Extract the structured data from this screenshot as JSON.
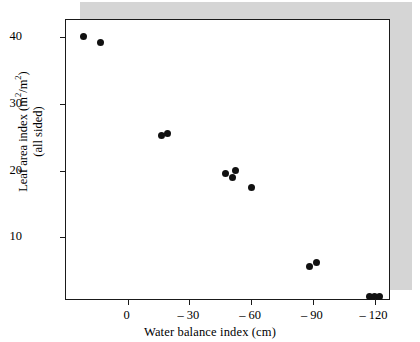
{
  "figure": {
    "background_color": "#ffffff",
    "shadow_color": "#d5d5d5",
    "frame_color": "#1a1a1a",
    "point_color": "#111111"
  },
  "chart_data": {
    "type": "scatter",
    "title": "",
    "xlabel": "Water balance index (cm)",
    "ylabel_line1": "Leaf area index (m",
    "ylabel_line1_sup1": "2",
    "ylabel_line1_mid": "/m",
    "ylabel_line1_sup2": "2",
    "ylabel_line1_end": ")",
    "ylabel_line2": "(all sided)",
    "ylabel_full": "Leaf area index (m2/m2) (all sided)",
    "xlim": [
      30,
      -128
    ],
    "ylim": [
      0.5,
      42.5
    ],
    "xticks": [
      0,
      -30,
      -60,
      -90,
      -120
    ],
    "xtick_labels": [
      "0",
      "– 30",
      "– 60",
      "– 90",
      "– 120"
    ],
    "yticks": [
      40,
      30,
      20,
      10
    ],
    "ytick_labels": [
      "40",
      "30",
      "20",
      "10"
    ],
    "grid": false,
    "legend": null,
    "marker": "filled-circle",
    "points": [
      {
        "x": 21.6,
        "y": 40.0
      },
      {
        "x": 13.2,
        "y": 39.1
      },
      {
        "x": -16.5,
        "y": 25.3
      },
      {
        "x": -19.3,
        "y": 25.6
      },
      {
        "x": -47.5,
        "y": 19.5
      },
      {
        "x": -50.8,
        "y": 18.9
      },
      {
        "x": -52.2,
        "y": 20.0
      },
      {
        "x": -60.2,
        "y": 17.5
      },
      {
        "x": -88.5,
        "y": 5.6
      },
      {
        "x": -91.8,
        "y": 6.2
      },
      {
        "x": -117.6,
        "y": 1.2
      },
      {
        "x": -120.0,
        "y": 1.2
      },
      {
        "x": -122.4,
        "y": 1.2
      }
    ]
  }
}
